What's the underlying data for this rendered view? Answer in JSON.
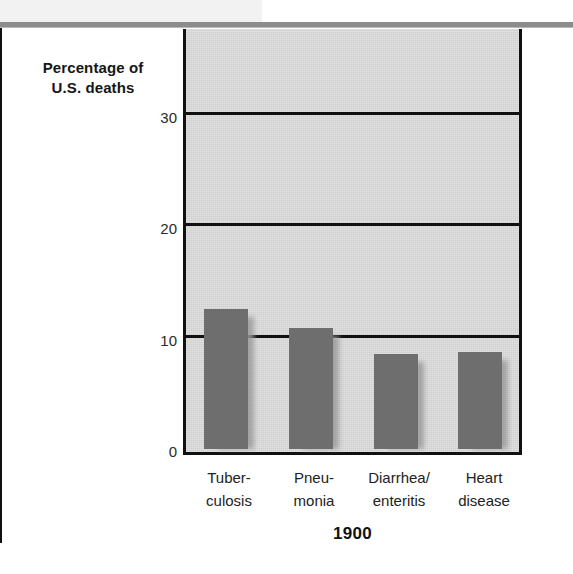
{
  "figure": {
    "axis_title_lines": [
      "Percentage of",
      "U.S. deaths"
    ],
    "year_label": "1900"
  },
  "chart_data": {
    "type": "bar",
    "title": "",
    "subtitle": "",
    "xlabel": "1900",
    "ylabel": "Percentage of U.S. deaths",
    "categories": [
      "Tuber-\nculosis",
      "Pneu-\nmonia",
      "Diarrhea/\nenteritis",
      "Heart\ndisease"
    ],
    "category_lines": [
      [
        "Tuber-",
        "culosis"
      ],
      [
        "Pneu-",
        "monia"
      ],
      [
        "Diarrhea/",
        "enteritis"
      ],
      [
        "Heart",
        "disease"
      ]
    ],
    "values": [
      12.6,
      10.9,
      8.5,
      8.7
    ],
    "ylim": [
      0,
      38
    ],
    "yticks": [
      0,
      10,
      20,
      30
    ],
    "ytick_labels": [
      "0",
      "10",
      "20",
      "30"
    ],
    "grid": true,
    "grid_axis": "y",
    "legend": "none",
    "bar_color": "#6e6e6e",
    "plot_background": "#cfcfcf",
    "axis_color": "#111111"
  }
}
